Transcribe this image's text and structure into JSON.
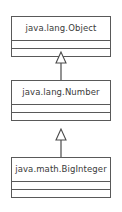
{
  "diagram": {
    "type": "uml-class-diagram",
    "background_color": "#ffffff",
    "line_color": "#595959",
    "text_color": "#3a3a3a"
  },
  "classes": [
    {
      "id": "object",
      "name": "java.lang.Object",
      "x": 11,
      "y": 16,
      "width": 100,
      "compartments": 2
    },
    {
      "id": "number",
      "name": "java.lang.Number",
      "x": 11,
      "y": 80,
      "width": 100,
      "compartments": 2
    },
    {
      "id": "biginteger",
      "name": "java.math.BigInteger",
      "x": 11,
      "y": 157,
      "width": 100,
      "compartments": 2
    }
  ],
  "relationships": [
    {
      "id": "number-extends-object",
      "kind": "generalization",
      "label": "extends",
      "from": "java.lang.Number",
      "to": "java.lang.Object",
      "y": 48,
      "height": 32
    },
    {
      "id": "biginteger-extends-number",
      "kind": "generalization",
      "label": "extends",
      "from": "java.math.BigInteger",
      "to": "java.lang.Number",
      "y": 125,
      "height": 32
    }
  ]
}
